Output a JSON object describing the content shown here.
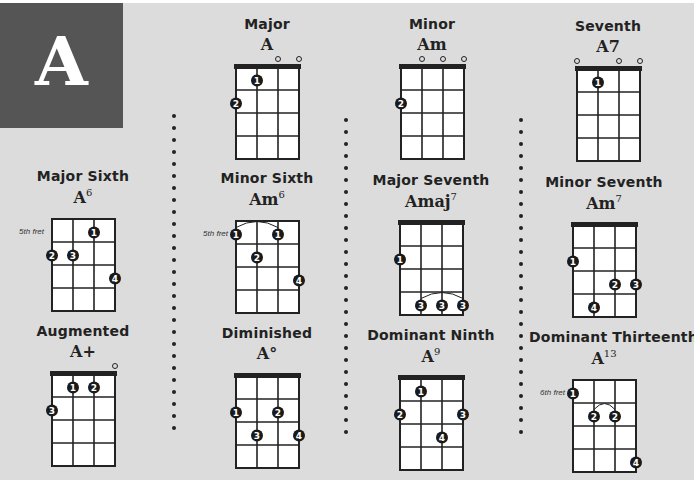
{
  "key_letter": "A",
  "colors": {
    "panel": "#dcdcdc",
    "letter_box": "#555555",
    "ink": "#222222",
    "grid_fill": "#ffffff"
  },
  "separators": [
    {
      "x": 174,
      "top": 114,
      "bottom": 432
    },
    {
      "x": 346,
      "top": 118,
      "bottom": 432
    },
    {
      "x": 521,
      "top": 118,
      "bottom": 432
    }
  ],
  "chords": [
    {
      "id": "major",
      "type": "Major",
      "root": "A",
      "suffix": "",
      "x": 192,
      "y": 16,
      "nut": true,
      "fret_label": "",
      "open": [
        false,
        false,
        true,
        true
      ],
      "dots": [
        {
          "string": 2,
          "fret": 1,
          "finger": "1"
        },
        {
          "string": 1,
          "fret": 2,
          "finger": "2"
        }
      ],
      "barres": []
    },
    {
      "id": "minor",
      "type": "Minor",
      "root": "Am",
      "suffix": "",
      "x": 357,
      "y": 16,
      "nut": true,
      "fret_label": "",
      "open": [
        false,
        true,
        true,
        true
      ],
      "dots": [
        {
          "string": 1,
          "fret": 2,
          "finger": "2"
        }
      ],
      "barres": []
    },
    {
      "id": "seventh",
      "type": "Seventh",
      "root": "A7",
      "suffix": "",
      "x": 533,
      "y": 18,
      "nut": true,
      "fret_label": "",
      "open": [
        true,
        false,
        true,
        true
      ],
      "dots": [
        {
          "string": 2,
          "fret": 1,
          "finger": "1"
        }
      ],
      "barres": []
    },
    {
      "id": "major-sixth",
      "type": "Major Sixth",
      "root": "A",
      "suffix": "6",
      "x": 8,
      "y": 168,
      "nut": false,
      "fret_label": "5th fret",
      "open": [
        false,
        false,
        false,
        false
      ],
      "dots": [
        {
          "string": 3,
          "fret": 1,
          "finger": "1"
        },
        {
          "string": 1,
          "fret": 2,
          "finger": "2"
        },
        {
          "string": 2,
          "fret": 2,
          "finger": "3"
        },
        {
          "string": 4,
          "fret": 3,
          "finger": "4"
        }
      ],
      "barres": []
    },
    {
      "id": "minor-sixth",
      "type": "Minor Sixth",
      "root": "Am",
      "suffix": "6",
      "x": 192,
      "y": 170,
      "nut": false,
      "fret_label": "5th fret",
      "open": [
        false,
        false,
        false,
        false
      ],
      "dots": [
        {
          "string": 1,
          "fret": 1,
          "finger": "1"
        },
        {
          "string": 3,
          "fret": 1,
          "finger": "1"
        },
        {
          "string": 2,
          "fret": 2,
          "finger": "2"
        },
        {
          "string": 4,
          "fret": 3,
          "finger": "4"
        }
      ],
      "barres": [
        {
          "fret": 1,
          "from": 1,
          "to": 3
        }
      ]
    },
    {
      "id": "major-seventh",
      "type": "Major Seventh",
      "root": "Amaj",
      "suffix": "7",
      "x": 356,
      "y": 172,
      "nut": true,
      "fret_label": "",
      "open": [
        false,
        false,
        false,
        false
      ],
      "dots": [
        {
          "string": 1,
          "fret": 2,
          "finger": "1"
        },
        {
          "string": 2,
          "fret": 4,
          "finger": "3"
        },
        {
          "string": 3,
          "fret": 4,
          "finger": "3"
        },
        {
          "string": 4,
          "fret": 4,
          "finger": "3"
        }
      ],
      "barres": [
        {
          "fret": 4,
          "from": 2,
          "to": 4
        }
      ]
    },
    {
      "id": "minor-seventh",
      "type": "Minor Seventh",
      "root": "Am",
      "suffix": "7",
      "x": 529,
      "y": 174,
      "nut": true,
      "fret_label": "",
      "open": [
        false,
        false,
        false,
        false
      ],
      "dots": [
        {
          "string": 1,
          "fret": 2,
          "finger": "1"
        },
        {
          "string": 3,
          "fret": 3,
          "finger": "2"
        },
        {
          "string": 4,
          "fret": 3,
          "finger": "3"
        },
        {
          "string": 2,
          "fret": 4,
          "finger": "4"
        }
      ],
      "barres": []
    },
    {
      "id": "augmented",
      "type": "Augmented",
      "root": "A+",
      "suffix": "",
      "x": 8,
      "y": 323,
      "nut": true,
      "fret_label": "",
      "open": [
        false,
        false,
        false,
        true
      ],
      "dots": [
        {
          "string": 2,
          "fret": 1,
          "finger": "1"
        },
        {
          "string": 3,
          "fret": 1,
          "finger": "2"
        },
        {
          "string": 1,
          "fret": 2,
          "finger": "3"
        }
      ],
      "barres": []
    },
    {
      "id": "diminished",
      "type": "Diminished",
      "root": "A°",
      "suffix": "",
      "x": 192,
      "y": 325,
      "nut": true,
      "fret_label": "",
      "open": [
        false,
        false,
        false,
        false
      ],
      "dots": [
        {
          "string": 1,
          "fret": 2,
          "finger": "1"
        },
        {
          "string": 3,
          "fret": 2,
          "finger": "2"
        },
        {
          "string": 2,
          "fret": 3,
          "finger": "3"
        },
        {
          "string": 4,
          "fret": 3,
          "finger": "4"
        }
      ],
      "barres": []
    },
    {
      "id": "dominant-ninth",
      "type": "Dominant Ninth",
      "root": "A",
      "suffix": "9",
      "x": 356,
      "y": 327,
      "nut": true,
      "fret_label": "",
      "open": [
        false,
        false,
        false,
        false
      ],
      "dots": [
        {
          "string": 2,
          "fret": 1,
          "finger": "1"
        },
        {
          "string": 1,
          "fret": 2,
          "finger": "2"
        },
        {
          "string": 4,
          "fret": 2,
          "finger": "3"
        },
        {
          "string": 3,
          "fret": 3,
          "finger": "4"
        }
      ],
      "barres": []
    },
    {
      "id": "dominant-thirteenth",
      "type": "Dominant Thirteenth",
      "root": "A",
      "suffix": "13",
      "x": 529,
      "y": 329,
      "nut": false,
      "fret_label": "6th fret",
      "open": [
        false,
        false,
        false,
        false
      ],
      "dots": [
        {
          "string": 1,
          "fret": 1,
          "finger": "1"
        },
        {
          "string": 2,
          "fret": 2,
          "finger": "2"
        },
        {
          "string": 3,
          "fret": 2,
          "finger": "2"
        },
        {
          "string": 4,
          "fret": 4,
          "finger": "4"
        }
      ],
      "barres": [
        {
          "fret": 2,
          "from": 2,
          "to": 3
        }
      ]
    }
  ]
}
